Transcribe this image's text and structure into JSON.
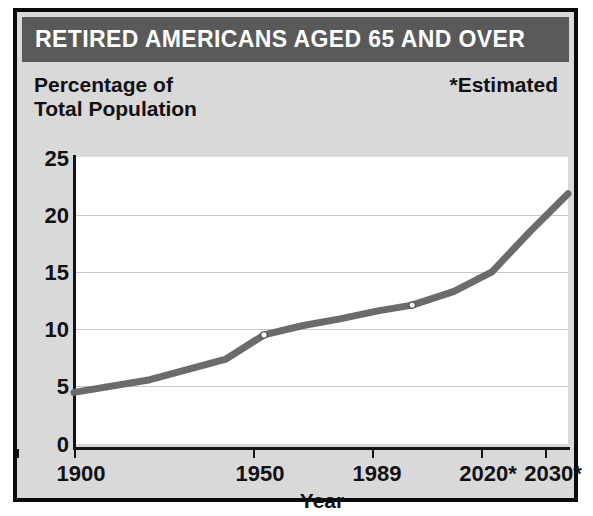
{
  "figure": {
    "title": "RETIRED AMERICANS AGED 65 AND OVER",
    "axis_title": "Percentage of\nTotal Population",
    "estimated_note": "*Estimated",
    "colors": {
      "title_bar": "#595959",
      "title_text": "#ffffff",
      "panel_background": "#d9d9d9",
      "plot_background": "#ffffff",
      "border": "#0a0a0a",
      "line": "#6b6b6b",
      "gridline": "#c9c9c9",
      "marker_fill": "#ffffff"
    }
  },
  "chart_data": {
    "type": "line",
    "title": "RETIRED AMERICANS AGED 65 AND OVER",
    "subtitle": "*Estimated",
    "xlabel": "Year",
    "ylabel": "Percentage of Total Population",
    "xlim": [
      1900,
      2030
    ],
    "ylim": [
      0,
      25
    ],
    "grid": true,
    "legend": "none",
    "x_tick_labels": [
      "1900",
      "1950",
      "1989",
      "2020*",
      "2030*"
    ],
    "x_tick_values": [
      1900,
      1950,
      1989,
      2020,
      2030
    ],
    "y_tick_labels": [
      "0",
      "5",
      "10",
      "15",
      "20",
      "25"
    ],
    "y_tick_values": [
      0,
      5,
      10,
      15,
      20,
      25
    ],
    "x": [
      1900,
      1950,
      1989,
      2020,
      2030
    ],
    "values": [
      4.5,
      9.5,
      12.1,
      18.5,
      21.8
    ],
    "markers_at": [
      1950,
      1989
    ],
    "series": [
      {
        "name": "Retired Americans aged 65 and over",
        "x": [
          1900,
          1920,
          1940,
          1950,
          1960,
          1970,
          1980,
          1989,
          2000,
          2010,
          2020,
          2030
        ],
        "values": [
          4.5,
          5.6,
          7.4,
          9.5,
          10.3,
          10.9,
          11.6,
          12.1,
          13.3,
          15.0,
          18.5,
          21.8
        ]
      }
    ]
  }
}
